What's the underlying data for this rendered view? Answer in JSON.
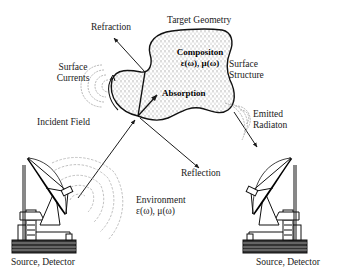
{
  "diagram": {
    "labels": {
      "target_geometry": "Target Geometry",
      "refraction": "Refraction",
      "composition_line1": "Compositon",
      "composition_line2": "ε(ω), μ(ω)",
      "surface_structure_line1": "Surface",
      "surface_structure_line2": "Structure",
      "surface_currents_line1": "Surface",
      "surface_currents_line2": "Currents",
      "absorption": "Absorption",
      "incident_field": "Incident Field",
      "emitted_radiation_line1": "Emitted",
      "emitted_radiation_line2": "Radiaton",
      "reflection": "Reflection",
      "environment_line1": "Environment",
      "environment_line2": "ε(ω), μ(ω)",
      "left_antenna": "Source, Detector",
      "right_antenna": "Source, Detector"
    },
    "colors": {
      "line": "#1a1a1a",
      "wave": "#9a9a9a",
      "stipple": "#8a8a8a",
      "background": "#ffffff"
    }
  }
}
